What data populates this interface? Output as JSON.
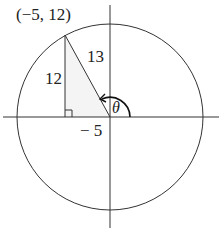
{
  "diagram": {
    "type": "unit-circle-reference-triangle",
    "point_label": "(−5, 12)",
    "point": {
      "x": -5,
      "y": 12
    },
    "opposite_label": "12",
    "hypotenuse_label": "13",
    "adjacent_label": "− 5",
    "angle_label": "θ",
    "colors": {
      "stroke": "#333333",
      "triangle_fill": "#f2f2f2",
      "background": "#ffffff"
    }
  }
}
